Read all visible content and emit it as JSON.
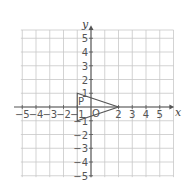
{
  "diagram": {
    "type": "coordinate-plane",
    "x_axis": {
      "label": "x",
      "min": -5,
      "max": 5,
      "ticks": [
        -5,
        -4,
        -3,
        -2,
        -1,
        2,
        3,
        4,
        5
      ]
    },
    "y_axis": {
      "label": "y",
      "min": -5,
      "max": 5,
      "ticks": [
        5,
        4,
        3,
        2,
        1,
        -1,
        -2,
        -3,
        -4,
        -5
      ]
    },
    "grid": {
      "x_min": -5,
      "x_max": 6,
      "y_min": -5,
      "y_max": 5
    },
    "origin_label": "O",
    "shape": {
      "name": "triangle",
      "label": "P",
      "vertices": [
        [
          -1,
          1
        ],
        [
          -1,
          -1
        ],
        [
          2,
          0
        ]
      ]
    },
    "colors": {
      "grid": "#c8c8c8",
      "axis": "#555555",
      "shape": "#555555"
    }
  }
}
